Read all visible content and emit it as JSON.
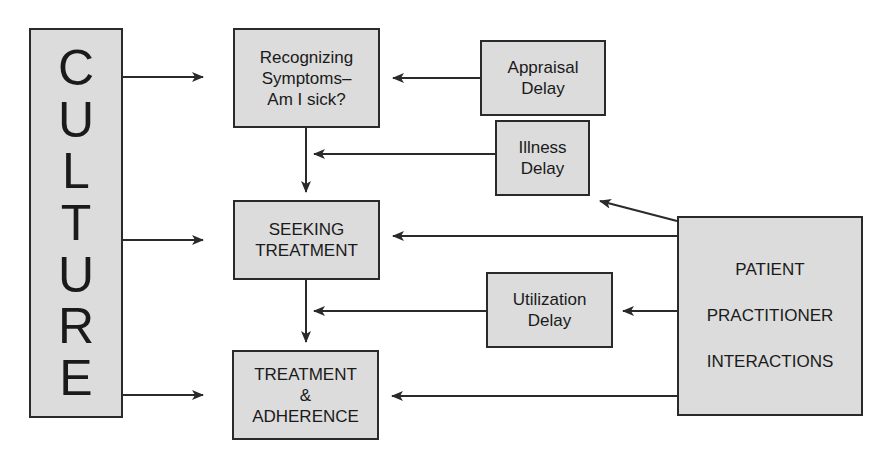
{
  "diagram": {
    "culture": {
      "letters": [
        "C",
        "U",
        "L",
        "T",
        "U",
        "R",
        "E"
      ]
    },
    "stages": {
      "recognizing": {
        "lines": [
          "Recognizing",
          "Symptoms–",
          "Am I sick?"
        ]
      },
      "seeking": {
        "lines": [
          "SEEKING",
          "TREATMENT"
        ]
      },
      "treatment": {
        "lines": [
          "TREATMENT",
          "&",
          "ADHERENCE"
        ]
      }
    },
    "delays": {
      "appraisal": {
        "lines": [
          "Appraisal",
          "Delay"
        ]
      },
      "illness": {
        "lines": [
          "Illness",
          "Delay"
        ]
      },
      "utilization": {
        "lines": [
          "Utilization",
          "Delay"
        ]
      }
    },
    "interactions": {
      "lines": [
        "PATIENT",
        "PRACTITIONER",
        "INTERACTIONS"
      ]
    },
    "colors": {
      "box_fill": "#dcdcdc",
      "stroke": "#2a2a2a",
      "background": "#ffffff"
    }
  }
}
